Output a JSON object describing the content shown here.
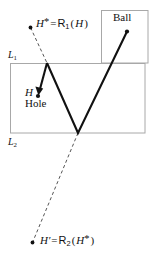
{
  "figure": {
    "colors": {
      "stroke": "#111111",
      "box_border": "#a8a8a8",
      "dashed": "#555555",
      "background": "#ffffff"
    },
    "labels": {
      "h_star": {
        "base": "H",
        "star": "*",
        "eq": "=",
        "op": "R",
        "sub": "1",
        "arg_open": "(",
        "arg": "H",
        "arg_close": ")"
      },
      "ball": "Ball",
      "l1": {
        "base": "L",
        "sub": "1"
      },
      "h": "H",
      "hole": "Hole",
      "l2": {
        "base": "L",
        "sub": "2"
      },
      "h_prime": {
        "base": "H",
        "prime": "′",
        "eq": "=",
        "op": "R",
        "sub": "2",
        "arg_open": "(",
        "arg": "H",
        "arg_star": "*",
        "arg_close": ")"
      }
    },
    "geometry": {
      "box_l1": {
        "x": 101,
        "y": 10,
        "w": 47,
        "h": 53
      },
      "box_l2": {
        "x": 10,
        "y": 63,
        "w": 135,
        "h": 70
      },
      "point_h_star": {
        "x": 30,
        "y": 27
      },
      "point_ball": {
        "x": 127,
        "y": 31
      },
      "point_hole": {
        "x": 38,
        "y": 95
      },
      "point_h_prime": {
        "x": 32,
        "y": 243
      },
      "bounce_upper": {
        "x": 47,
        "y": 63
      },
      "bounce_lower": {
        "x": 78,
        "y": 133
      }
    }
  }
}
